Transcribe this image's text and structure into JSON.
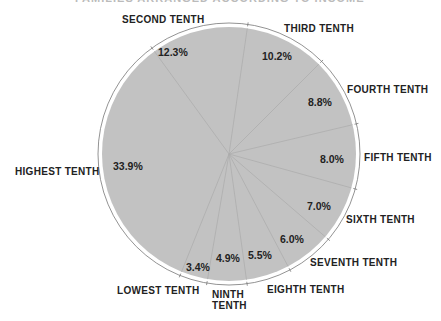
{
  "title": "FAMILIES ARRANGED ACCORDING TO INCOME",
  "chart_data": {
    "type": "pie",
    "categories": [
      "Second Tenth",
      "Third Tenth",
      "Fourth Tenth",
      "Fifth Tenth",
      "Sixth Tenth",
      "Seventh Tenth",
      "Eighth Tenth",
      "Ninth Tenth",
      "Lowest Tenth",
      "Highest Tenth"
    ],
    "labels": [
      "SECOND TENTH",
      "THIRD TENTH",
      "FOURTH TENTH",
      "FIFTH TENTH",
      "SIXTH TENTH",
      "SEVENTH TENTH",
      "EIGHTH TENTH",
      "NINTH TENTH",
      "LOWEST TENTH",
      "HIGHEST TENTH"
    ],
    "values": [
      12.3,
      10.2,
      8.8,
      8.0,
      7.0,
      6.0,
      5.5,
      4.9,
      3.4,
      33.9
    ],
    "value_labels": [
      "12.3%",
      "10.2%",
      "8.8%",
      "8.0%",
      "6.0%",
      "7.0%",
      "5.5%",
      "4.9%",
      "3.4%",
      "33.9%"
    ],
    "start_angle_deg_clockwise_from_top": 324,
    "direction": "clockwise",
    "fill_color": "#c2c2c2",
    "legend": "none (labels placed around perimeter)"
  },
  "labels": {
    "second": "SECOND TENTH",
    "third": "THIRD TENTH",
    "fourth": "FOURTH TENTH",
    "fifth": "FIFTH TENTH",
    "sixth": "SIXTH TENTH",
    "seventh": "SEVENTH TENTH",
    "eighth": "EIGHTH TENTH",
    "ninth_1": "NINTH",
    "ninth_2": "TENTH",
    "lowest": "LOWEST TENTH",
    "highest": "HIGHEST TENTH"
  },
  "pcts": {
    "second": "12.3%",
    "third": "10.2%",
    "fourth": "8.8%",
    "fifth": "8.0%",
    "sixth": "7.0%",
    "seventh": "6.0%",
    "eighth": "5.5%",
    "ninth": "4.9%",
    "lowest": "3.4%",
    "highest": "33.9%"
  }
}
